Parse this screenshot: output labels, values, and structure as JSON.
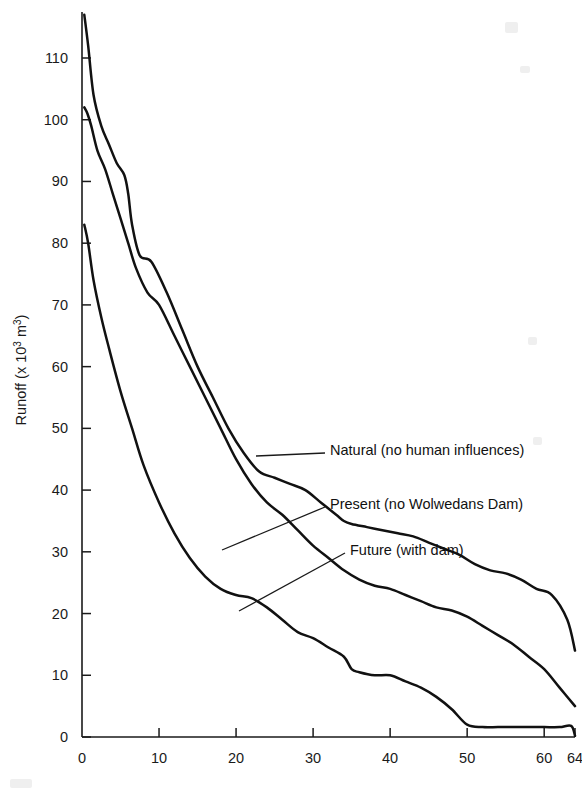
{
  "chart_data": {
    "type": "line",
    "title": "",
    "xlabel": "",
    "ylabel": "Runoff (x 10³ m³)",
    "ylabel_base": "Runoff (x 10",
    "ylabel_exp": "3",
    "ylabel_tail": " m",
    "ylabel_exp2": "3",
    "ylabel_close": ")",
    "xlim": [
      0,
      64
    ],
    "ylim": [
      0,
      118
    ],
    "grid": false,
    "legend_position": "inline-annotations",
    "xticks": [
      0,
      10,
      20,
      30,
      40,
      50,
      60,
      64
    ],
    "xtick_labels": [
      "0",
      "10",
      "20",
      "30",
      "40",
      "50",
      "60",
      "64"
    ],
    "yticks": [
      0,
      10,
      20,
      30,
      40,
      50,
      60,
      70,
      80,
      90,
      100,
      110
    ],
    "ytick_labels": [
      "0",
      "10",
      "20",
      "30",
      "40",
      "50",
      "60",
      "70",
      "80",
      "90",
      "100",
      "110"
    ],
    "series": [
      {
        "name": "Natural (no human influences)",
        "annotation": "Natural (no human influences)",
        "x": [
          0.3,
          0.8,
          1.5,
          2.5,
          3.5,
          4.5,
          5.5,
          6.0,
          6.5,
          7.5,
          9,
          11,
          13,
          15,
          17,
          19,
          21,
          23,
          25,
          27,
          29,
          31,
          33,
          34,
          35,
          37,
          39,
          41,
          43,
          45,
          47,
          49,
          51,
          53,
          55,
          57,
          59,
          61,
          63,
          64
        ],
        "y": [
          117,
          112,
          104,
          99,
          96,
          93,
          91,
          88,
          83,
          78,
          77,
          72,
          66,
          60,
          55,
          50,
          46,
          43,
          42,
          41,
          40,
          38,
          36,
          35,
          34.5,
          34,
          33.5,
          33,
          32.5,
          31.5,
          30.5,
          29.5,
          28,
          27,
          26.5,
          25.5,
          24,
          23,
          19,
          14
        ]
      },
      {
        "name": "Present (no Wolwedans Dam)",
        "annotation": "Present (no Wolwedans Dam)",
        "x": [
          0.3,
          0.7,
          1.2,
          2.0,
          3.0,
          4.0,
          5.0,
          6.0,
          7.0,
          8.5,
          10,
          12,
          14,
          16,
          18,
          20,
          22,
          24,
          26,
          28,
          30,
          32,
          34,
          36,
          38,
          40,
          42,
          44,
          46,
          48,
          50,
          52,
          54,
          56,
          58,
          60,
          62,
          64
        ],
        "y": [
          102,
          101,
          99,
          95,
          92,
          88,
          84,
          80,
          76,
          72,
          70,
          65,
          60,
          55,
          50,
          45,
          41,
          38,
          36,
          33.5,
          31,
          29,
          27,
          25.5,
          24.5,
          24,
          23,
          22,
          21,
          20.5,
          19.5,
          18,
          16.5,
          15,
          13,
          11,
          8,
          5
        ]
      },
      {
        "name": "Future (with dam)",
        "annotation": "Future (with dam)",
        "x": [
          0.3,
          0.8,
          1.5,
          2.5,
          3.5,
          5,
          6.5,
          8,
          10,
          12,
          14,
          16,
          18,
          20,
          22,
          24,
          26,
          28,
          30,
          32,
          34,
          35,
          36,
          38,
          40,
          42,
          44,
          46,
          48,
          50,
          52,
          54,
          56,
          58,
          60,
          62,
          63.5,
          64
        ],
        "y": [
          83,
          80,
          74,
          68,
          63,
          56,
          50,
          44,
          38,
          33,
          29,
          26,
          24,
          23,
          22.5,
          21,
          19,
          17,
          16,
          14.5,
          13,
          11,
          10.5,
          10,
          10,
          9,
          8,
          6.5,
          4.5,
          2,
          1.6,
          1.6,
          1.6,
          1.6,
          1.6,
          1.6,
          1.8,
          0.2
        ]
      }
    ],
    "annotations": [
      {
        "label": "Natural (no human influences)",
        "text_x": 330,
        "text_y": 450,
        "leader_from_x": 325,
        "leader_from_y": 453,
        "leader_to_x": 256,
        "leader_to_y": 456
      },
      {
        "label": "Present (no Wolwedans Dam)",
        "text_x": 330,
        "text_y": 504,
        "leader_from_x": 325,
        "leader_from_y": 507,
        "leader_to_x": 222,
        "leader_to_y": 550
      },
      {
        "label": "Future (with dam)",
        "text_x": 350,
        "text_y": 550,
        "leader_from_x": 345,
        "leader_from_y": 553,
        "leader_to_x": 239,
        "leader_to_y": 611
      }
    ]
  }
}
